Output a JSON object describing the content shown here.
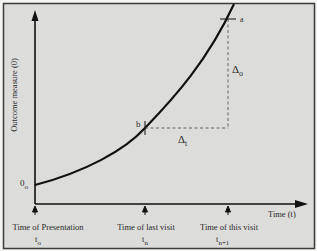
{
  "diagram": {
    "y_axis_label": "Outcome measure (0)",
    "x_axis_label": "Time (t)",
    "origin_label": {
      "main": "0",
      "sub": "o"
    },
    "point_a_label": "a",
    "point_b_label": "b",
    "delta_o": {
      "main": "Δ",
      "sub": "o"
    },
    "delta_t": {
      "main": "Δ",
      "sub": "t"
    },
    "time_markers": [
      {
        "label": "Time of Presentation",
        "t_main": "t",
        "t_sub": "o"
      },
      {
        "label": "Time of last visit",
        "t_main": "t",
        "t_sub": "n"
      },
      {
        "label": "Time of this visit",
        "t_main": "t",
        "t_sub": "n+1"
      }
    ],
    "colors": {
      "background": "#dcdcda",
      "frame": "#3a3a3a",
      "ink": "#111111",
      "dash": "#555555"
    }
  }
}
